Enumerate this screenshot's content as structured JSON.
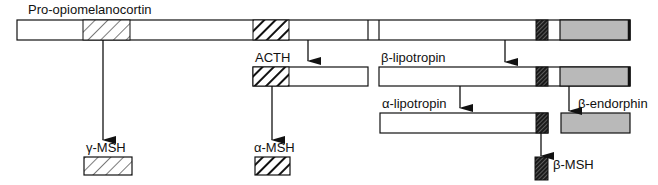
{
  "title": "Pro-opiomelanocortin",
  "labels": {
    "precursor": "Pro-opiomelanocortin",
    "acth": "ACTH",
    "beta_lipotropin": "β-lipotropin",
    "alpha_lipotropin": "α-lipotropin",
    "beta_endorphin": "β-endorphin",
    "gamma_msh": "γ-MSH",
    "alpha_msh": "α-MSH",
    "beta_msh": "β-MSH"
  },
  "colors": {
    "outline": "#111111",
    "fill_white": "#ffffff",
    "fill_gray": "#b9b9b9",
    "hatch_light": "#333333",
    "hatch_dark": "#111111"
  },
  "segments": {
    "precursor": [
      {
        "name": "n-terminal",
        "x1": 17,
        "x2": 83,
        "fill": "white"
      },
      {
        "name": "gamma-msh-region",
        "x1": 83,
        "x2": 130,
        "fill": "hatch-light"
      },
      {
        "name": "spacer-1",
        "x1": 130,
        "x2": 253,
        "fill": "white"
      },
      {
        "name": "alpha-msh-region",
        "x1": 253,
        "x2": 289,
        "fill": "hatch-dark"
      },
      {
        "name": "acth-rest",
        "x1": 289,
        "x2": 368,
        "fill": "white"
      },
      {
        "name": "junction",
        "x1": 368,
        "x2": 379,
        "fill": "white"
      },
      {
        "name": "lipotropin-body",
        "x1": 379,
        "x2": 536,
        "fill": "white"
      },
      {
        "name": "beta-msh-region",
        "x1": 536,
        "x2": 548,
        "fill": "hatch-fine"
      },
      {
        "name": "spacer-2",
        "x1": 548,
        "x2": 560,
        "fill": "white"
      },
      {
        "name": "beta-endorphin-region",
        "x1": 560,
        "x2": 630,
        "fill": "gray"
      }
    ]
  }
}
